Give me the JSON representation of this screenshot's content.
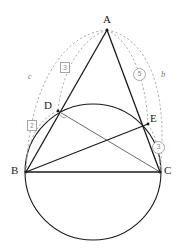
{
  "figure": {
    "kind": "geometry-diagram",
    "background_color": "#ffffff",
    "solid_stroke_color": "#1a1a1a",
    "dashed_stroke_color": "#a5a5a5",
    "points": [
      {
        "id": "A",
        "label": "A",
        "x": 107,
        "y": 30,
        "label_x": 103,
        "label_y": 14
      },
      {
        "id": "B",
        "label": "B",
        "x": 26,
        "y": 172,
        "label_x": 11,
        "label_y": 165
      },
      {
        "id": "C",
        "label": "C",
        "x": 160,
        "y": 172,
        "label_x": 164,
        "label_y": 165
      },
      {
        "id": "D",
        "label": "D",
        "x": 58,
        "y": 111,
        "label_x": 44,
        "label_y": 100
      },
      {
        "id": "E",
        "label": "E",
        "x": 148,
        "y": 124,
        "label_x": 150,
        "label_y": 113
      }
    ],
    "segments": [
      {
        "name": "segment-AB",
        "from": "A",
        "to": "B"
      },
      {
        "name": "segment-AC",
        "from": "A",
        "to": "C"
      },
      {
        "name": "segment-BC",
        "from": "B",
        "to": "C"
      },
      {
        "name": "segment-DC",
        "from": "D",
        "to": "C"
      },
      {
        "name": "segment-BE",
        "from": "B",
        "to": "E"
      }
    ],
    "circle": {
      "name": "main-circle",
      "cx": 93,
      "cy": 172,
      "r": 68
    },
    "right_angle_marker": {
      "name": "angle-marker-at-D",
      "cx": 63,
      "cy": 117,
      "r": 3.5
    },
    "arcs": [
      {
        "name": "arc-c",
        "label": "c",
        "label_style": "italic",
        "from": "A",
        "to": "B",
        "label_x": 28,
        "label_y": 72
      },
      {
        "name": "arc-3-left",
        "label": "3",
        "label_style": "boxed",
        "from": "A",
        "to": "D",
        "label_x": 60,
        "label_y": 62
      },
      {
        "name": "arc-2",
        "label": "2",
        "label_style": "boxed",
        "from": "D",
        "to": "B",
        "label_x": 27,
        "label_y": 120
      },
      {
        "name": "arc-5",
        "label": "5",
        "label_style": "circled",
        "from": "A",
        "to": "E",
        "label_x": 133,
        "label_y": 68
      },
      {
        "name": "arc-b",
        "label": "b",
        "label_style": "italic",
        "from": "A",
        "to": "C",
        "label_x": 161,
        "label_y": 70
      },
      {
        "name": "arc-3-right",
        "label": "3",
        "label_style": "circled",
        "from": "E",
        "to": "C",
        "label_x": 152,
        "label_y": 141
      }
    ]
  }
}
